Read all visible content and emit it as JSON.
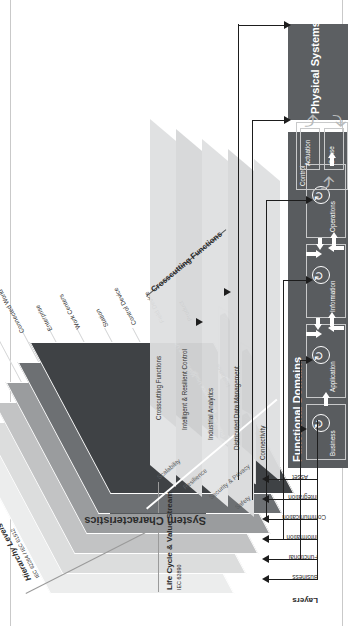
{
  "figure": {
    "background": "#ffffff",
    "orientation": "rotated-90-ccw"
  },
  "rami": {
    "axes": {
      "hierarchy": {
        "title": "Hierarchy Levels",
        "standard": "IEC 62264 / IEC 61512"
      },
      "lifecycle": {
        "title": "Life Cycle & Value Stream",
        "standard": "IEC 62890"
      },
      "layers_title": "Layers"
    },
    "layers": [
      {
        "name": "Business",
        "color": "#eceded"
      },
      {
        "name": "Functional",
        "color": "#dcdddd"
      },
      {
        "name": "Information",
        "color": "#c2c3c4"
      },
      {
        "name": "Communication",
        "color": "#9a9c9e"
      },
      {
        "name": "Integration",
        "color": "#6d7073"
      },
      {
        "name": "Asset",
        "color": "#3f4245"
      }
    ],
    "hierarchy_levels": [
      "Connected World",
      "Enterprise",
      "Work Centers",
      "Station",
      "Control Device",
      "Field Device",
      "Product"
    ],
    "lifecycle": {
      "type": {
        "label": "Type",
        "stages": [
          "Development",
          "Maintenance Usage"
        ]
      },
      "instance": {
        "label": "Instance",
        "stages": [
          "Production",
          "Maintenance Usage"
        ]
      }
    }
  },
  "iira": {
    "crosscutting_title": "Crosscutting Functions",
    "crosscutting_functions": [
      "Crosscutting Functions",
      "Intelligent & Resilient Control",
      "Industrial Analytics",
      "Distributed Data Management",
      "Connectivity"
    ],
    "system_characteristics_title": "System Characteristics",
    "system_characteristics": [
      "Scalability",
      "Resilience",
      "Security & Privacy",
      "Safety"
    ],
    "functional_domains": {
      "title": "Functional Domains",
      "business": "Business",
      "domains": [
        "Application",
        "Information",
        "Operations"
      ],
      "control": {
        "label": "Control",
        "sub": [
          "Actuation",
          "Sense"
        ]
      }
    },
    "physical_systems": "Physical Systems"
  },
  "colors": {
    "dark_box": "#595c5f",
    "band": "#dedfe0",
    "line": "#1d1d1d",
    "white": "#ffffff"
  }
}
